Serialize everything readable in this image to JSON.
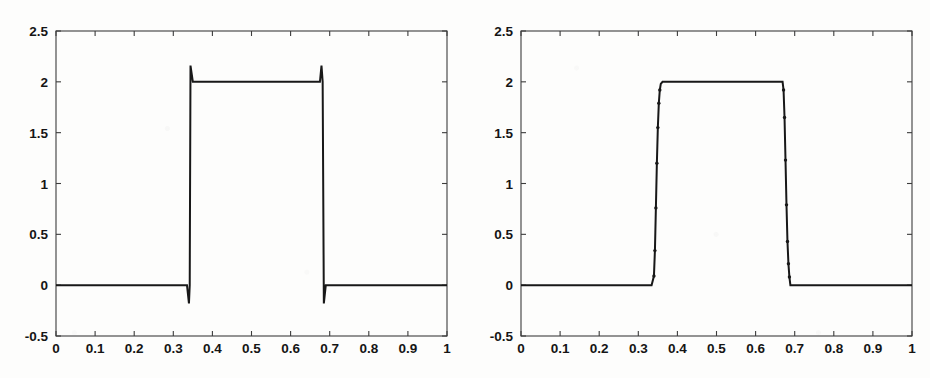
{
  "figure": {
    "background_color": "#fdfdfc",
    "line_color": "#181818",
    "axis_color": "#3c3c3c",
    "panel_count": 2
  },
  "chart_data": [
    {
      "panel": "left",
      "type": "line",
      "title": "",
      "xlabel": "",
      "ylabel": "",
      "xlim": [
        0,
        1
      ],
      "ylim": [
        -0.5,
        2.5
      ],
      "grid": false,
      "legend": null,
      "xticks": [
        0,
        0.1,
        0.2,
        0.3,
        0.4,
        0.5,
        0.6,
        0.7,
        0.8,
        0.9,
        1
      ],
      "xticklabels": [
        "0",
        "0.1",
        "0.2",
        "0.3",
        "0.4",
        "0.5",
        "0.6",
        "0.7",
        "0.8",
        "0.9",
        "1"
      ],
      "yticks": [
        -0.5,
        0,
        0.5,
        1,
        1.5,
        2,
        2.5
      ],
      "yticklabels": [
        "-0.5",
        "0",
        "0.5",
        "1",
        "1.5",
        "2",
        "2.5"
      ],
      "description": "Square pulse of amplitude 2 on the interval 0.342 to 0.682, with small Gibbs overshoot spikes at both discontinuities (undershoot to about -0.18 and overshoot to about 2.16).",
      "series": [
        {
          "name": "sharp-reconstruction",
          "step_low": 0,
          "step_high": 2,
          "rise_x": 0.342,
          "fall_x": 0.682,
          "overshoot_high": 2.16,
          "undershoot_low": -0.18,
          "x": [
            0.0,
            0.05,
            0.1,
            0.15,
            0.2,
            0.25,
            0.3,
            0.335,
            0.34,
            0.342,
            0.344,
            0.35,
            0.4,
            0.45,
            0.5,
            0.55,
            0.6,
            0.65,
            0.675,
            0.679,
            0.682,
            0.685,
            0.69,
            0.75,
            0.8,
            0.85,
            0.9,
            0.95,
            1.0
          ],
          "y": [
            0.0,
            0.0,
            0.0,
            0.0,
            0.0,
            0.0,
            0.0,
            0.0,
            -0.18,
            0.0,
            2.16,
            2.0,
            2.0,
            2.0,
            2.0,
            2.0,
            2.0,
            2.0,
            2.0,
            2.16,
            2.0,
            -0.18,
            0.0,
            0.0,
            0.0,
            0.0,
            0.0,
            0.0,
            0.0
          ]
        }
      ]
    },
    {
      "panel": "right",
      "type": "line",
      "title": "",
      "xlabel": "",
      "ylabel": "",
      "xlim": [
        0,
        1
      ],
      "ylim": [
        -0.5,
        2.5
      ],
      "grid": false,
      "legend": null,
      "xticks": [
        0,
        0.1,
        0.2,
        0.3,
        0.4,
        0.5,
        0.6,
        0.7,
        0.8,
        0.9,
        1
      ],
      "xticklabels": [
        "0",
        "0.1",
        "0.2",
        "0.3",
        "0.4",
        "0.5",
        "0.6",
        "0.7",
        "0.8",
        "0.9",
        "1"
      ],
      "yticks": [
        -0.5,
        0,
        0.5,
        1,
        1.5,
        2,
        2.5
      ],
      "yticklabels": [
        "-0.5",
        "0",
        "0.5",
        "1",
        "1.5",
        "2",
        "2.5"
      ],
      "description": "Square pulse of amplitude 2 on the interval 0.34 to 0.69, with the two discontinuities resolved by a sparse sequence of isolated sample dots forming a monotone ramp; no overshoot.",
      "series": [
        {
          "name": "monotone-reconstruction",
          "step_low": 0,
          "step_high": 2,
          "rise_x": 0.345,
          "fall_x": 0.685,
          "x": [
            0.0,
            0.1,
            0.2,
            0.3,
            0.334,
            0.34,
            0.3425,
            0.345,
            0.3475,
            0.35,
            0.3525,
            0.355,
            0.3575,
            0.362,
            0.37,
            0.42,
            0.5,
            0.58,
            0.64,
            0.669,
            0.6715,
            0.674,
            0.6765,
            0.679,
            0.6815,
            0.684,
            0.6865,
            0.689,
            0.695,
            0.75,
            0.85,
            0.95,
            1.0
          ],
          "y": [
            0.0,
            0.0,
            0.0,
            0.0,
            0.0,
            0.09,
            0.34,
            0.76,
            1.2,
            1.55,
            1.79,
            1.92,
            1.98,
            2.0,
            2.0,
            2.0,
            2.0,
            2.0,
            2.0,
            2.0,
            1.92,
            1.65,
            1.23,
            0.79,
            0.43,
            0.21,
            0.08,
            0.0,
            0.0,
            0.0,
            0.0,
            0.0,
            0.0
          ]
        }
      ],
      "transition_dots_rise": [
        {
          "x": 0.34,
          "y": 0.09
        },
        {
          "x": 0.3425,
          "y": 0.34
        },
        {
          "x": 0.345,
          "y": 0.76
        },
        {
          "x": 0.3475,
          "y": 1.2
        },
        {
          "x": 0.35,
          "y": 1.55
        },
        {
          "x": 0.3525,
          "y": 1.79
        },
        {
          "x": 0.355,
          "y": 1.92
        }
      ],
      "transition_dots_fall": [
        {
          "x": 0.6715,
          "y": 1.92
        },
        {
          "x": 0.674,
          "y": 1.65
        },
        {
          "x": 0.6765,
          "y": 1.23
        },
        {
          "x": 0.679,
          "y": 0.79
        },
        {
          "x": 0.6815,
          "y": 0.43
        },
        {
          "x": 0.684,
          "y": 0.21
        },
        {
          "x": 0.6865,
          "y": 0.08
        }
      ]
    }
  ]
}
